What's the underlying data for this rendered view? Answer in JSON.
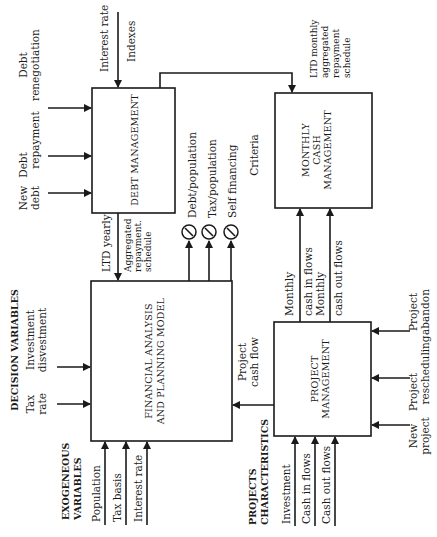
{
  "blocks": {
    "debt_management": "DEBT MANAGEMENT",
    "monthly_cash": [
      "MONTHLY",
      "CASH",
      "MANAGEMENT"
    ],
    "financial_model": [
      "FINANCIAL ANALYSIS",
      "AND PLANNING MODEL"
    ],
    "project_management": [
      "PROJECT",
      "MANAGEMENT"
    ]
  },
  "debt_inputs": {
    "top": [
      "Interest rate",
      "Indexes"
    ],
    "renegotiation": [
      "Debt",
      "renegotiation"
    ],
    "repayment": [
      "Debt",
      "repayment"
    ],
    "new_debt": [
      "New",
      "debt"
    ]
  },
  "debt_to_cash": [
    "LTD monthly",
    "aggregated",
    "repayment",
    "schedule"
  ],
  "debt_to_model": {
    "ltd_yearly": "LTD yearly",
    "aggregated": [
      "Aggregated",
      "repayment.",
      "schedule"
    ]
  },
  "criteria": {
    "label": "Criteria",
    "items": [
      "Debt/population",
      "Tax/population",
      "Self financing"
    ]
  },
  "decision_variables": {
    "title": "DECISION VARIABLES",
    "items": [
      [
        "Tax",
        "rate"
      ],
      [
        "Investment",
        "disvestment"
      ]
    ]
  },
  "exogeneous_variables": {
    "title": [
      "EXOGENEOUS",
      "VARIABLES"
    ],
    "items": [
      "Population",
      "Tax basis",
      "Interest rate"
    ]
  },
  "project_to_model": [
    "Project",
    "cash flow"
  ],
  "project_to_cash": {
    "in": [
      "Monthly",
      "cash in flows"
    ],
    "out": [
      "Monthly",
      "cash out flows"
    ]
  },
  "project_characteristics": {
    "title": [
      "PROJECTS",
      "CHARACTERISTICS"
    ],
    "items": [
      "Investment",
      "Cash in flows",
      "Cash out flows"
    ]
  },
  "project_decisions": {
    "abandon": [
      "Project",
      "abandon"
    ],
    "rescheduling": [
      "Project",
      "rescheduling"
    ],
    "new_project": [
      "New",
      "project"
    ]
  }
}
